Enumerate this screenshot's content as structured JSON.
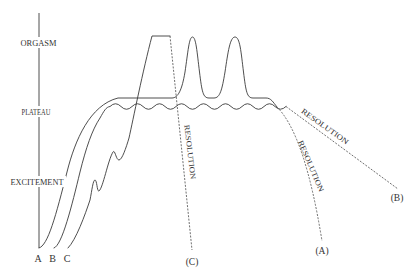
{
  "figure": {
    "phase_axis": {
      "orgasm": "ORGASM",
      "plateau": "PLATEAU",
      "excitement": "EXCITEMENT"
    },
    "curve_start_labels": {
      "a": "A",
      "b": "B",
      "c": "C"
    },
    "resolution_labels": {
      "a": "RESOLUTION",
      "b": "RESOLUTION",
      "c": "RESOLUTION"
    },
    "curve_end_labels": {
      "a": "(A)",
      "b": "(B)",
      "c": "(C)"
    }
  },
  "colors": {
    "background": "#ffffff",
    "line": "#3a3a3a",
    "text": "#333333"
  }
}
